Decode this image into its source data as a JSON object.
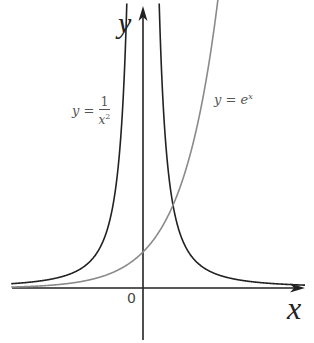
{
  "chart_data": {
    "type": "line",
    "title": "",
    "xlabel": "x",
    "ylabel": "y",
    "origin_label": "0",
    "grid": false,
    "legend": "inline annotations",
    "xlim": [
      -3.6,
      4.5
    ],
    "ylim": [
      -1.5,
      8
    ],
    "series": [
      {
        "name": "y = 1/x^2",
        "label_lhs": "y =",
        "label_num": "1",
        "label_den": "x",
        "label_exp": "2",
        "color": "#222222",
        "points_right": [
          [
            0.36,
            7.7
          ],
          [
            0.4,
            6.25
          ],
          [
            0.5,
            4.0
          ],
          [
            0.7,
            2.04
          ],
          [
            1.0,
            1.0
          ],
          [
            1.5,
            0.44
          ],
          [
            2.0,
            0.25
          ],
          [
            3.0,
            0.11
          ],
          [
            4.0,
            0.06
          ]
        ],
        "points_left": [
          [
            -0.36,
            7.7
          ],
          [
            -0.4,
            6.25
          ],
          [
            -0.5,
            4.0
          ],
          [
            -0.7,
            2.04
          ],
          [
            -1.0,
            1.0
          ],
          [
            -1.5,
            0.44
          ],
          [
            -2.0,
            0.25
          ],
          [
            -3.0,
            0.11
          ],
          [
            -3.6,
            0.08
          ]
        ]
      },
      {
        "name": "y = e^x",
        "label_lhs": "y = e",
        "label_exp": "x",
        "color": "#888888",
        "points": [
          [
            -3.6,
            0.03
          ],
          [
            -3.0,
            0.05
          ],
          [
            -2.0,
            0.14
          ],
          [
            -1.0,
            0.37
          ],
          [
            0.0,
            1.0
          ],
          [
            0.5,
            1.65
          ],
          [
            0.7,
            2.01
          ],
          [
            1.0,
            2.72
          ],
          [
            1.5,
            4.48
          ],
          [
            2.0,
            7.39
          ],
          [
            2.08,
            8.0
          ]
        ]
      }
    ],
    "annotations": [
      {
        "text": "intersection",
        "x": 0.7,
        "y": 2.01
      }
    ]
  }
}
